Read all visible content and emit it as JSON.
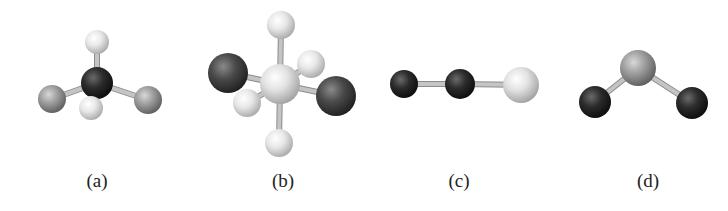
{
  "figure": {
    "background": "#ffffff",
    "panels": [
      {
        "id": "a",
        "label": "(a)",
        "label_x": 97,
        "geometry": "tetrahedral",
        "atoms": [
          {
            "name": "top-light",
            "x": 97,
            "y": 42,
            "r": 12,
            "shade": "white"
          },
          {
            "name": "left-gray",
            "x": 52,
            "y": 99,
            "r": 14,
            "shade": "gray"
          },
          {
            "name": "right-gray",
            "x": 148,
            "y": 100,
            "r": 14,
            "shade": "gray"
          },
          {
            "name": "center-dark",
            "x": 97,
            "y": 83,
            "r": 16,
            "shade": "black"
          },
          {
            "name": "front-light",
            "x": 91,
            "y": 108,
            "r": 12,
            "shade": "white"
          }
        ],
        "bonds": [
          [
            3,
            0
          ],
          [
            3,
            1
          ],
          [
            3,
            2
          ],
          [
            3,
            4
          ]
        ]
      },
      {
        "id": "b",
        "label": "(b)",
        "label_x": 283,
        "geometry": "octahedral",
        "atoms": [
          {
            "name": "top-light",
            "x": 281,
            "y": 25,
            "r": 14,
            "shade": "white"
          },
          {
            "name": "back-right-light",
            "x": 311,
            "y": 64,
            "r": 14,
            "shade": "white"
          },
          {
            "name": "left-dark",
            "x": 228,
            "y": 73,
            "r": 20,
            "shade": "dark"
          },
          {
            "name": "bottom-light",
            "x": 279,
            "y": 143,
            "r": 14,
            "shade": "white"
          },
          {
            "name": "center-light",
            "x": 280,
            "y": 84,
            "r": 20,
            "shade": "pale"
          },
          {
            "name": "right-dark",
            "x": 336,
            "y": 96,
            "r": 20,
            "shade": "dark"
          },
          {
            "name": "front-left-light",
            "x": 247,
            "y": 103,
            "r": 14,
            "shade": "white"
          }
        ],
        "bonds": [
          [
            4,
            0
          ],
          [
            4,
            1
          ],
          [
            4,
            2
          ],
          [
            4,
            3
          ],
          [
            4,
            5
          ],
          [
            4,
            6
          ]
        ]
      },
      {
        "id": "c",
        "label": "(c)",
        "label_x": 459,
        "geometry": "linear",
        "atoms": [
          {
            "name": "left-dark",
            "x": 404,
            "y": 84,
            "r": 14,
            "shade": "black"
          },
          {
            "name": "middle-dark",
            "x": 460,
            "y": 84,
            "r": 15,
            "shade": "black"
          },
          {
            "name": "right-light",
            "x": 521,
            "y": 85,
            "r": 18,
            "shade": "pale"
          }
        ],
        "bonds": [
          [
            0,
            1
          ],
          [
            1,
            2
          ]
        ]
      },
      {
        "id": "d",
        "label": "(d)",
        "label_x": 648,
        "geometry": "bent",
        "atoms": [
          {
            "name": "top-gray",
            "x": 638,
            "y": 68,
            "r": 18,
            "shade": "gray"
          },
          {
            "name": "left-dark",
            "x": 595,
            "y": 102,
            "r": 16,
            "shade": "black"
          },
          {
            "name": "right-dark",
            "x": 692,
            "y": 103,
            "r": 16,
            "shade": "black"
          }
        ],
        "bonds": [
          [
            0,
            1
          ],
          [
            0,
            2
          ]
        ]
      }
    ]
  },
  "shades": {
    "white": {
      "hi": "#ffffff",
      "mid": "#e8e8e8",
      "lo": "#a8a8a8"
    },
    "pale": {
      "hi": "#ffffff",
      "mid": "#e2e2e2",
      "lo": "#a0a0a0"
    },
    "gray": {
      "hi": "#d8d8d8",
      "mid": "#9e9e9e",
      "lo": "#5c5c5c"
    },
    "dark": {
      "hi": "#8a8a8a",
      "mid": "#4a4a4a",
      "lo": "#1e1e1e"
    },
    "black": {
      "hi": "#6a6a6a",
      "mid": "#2c2c2c",
      "lo": "#0c0c0c"
    }
  },
  "bond_color": "#c4c4c4",
  "bond_edge": "#8c8c8c"
}
